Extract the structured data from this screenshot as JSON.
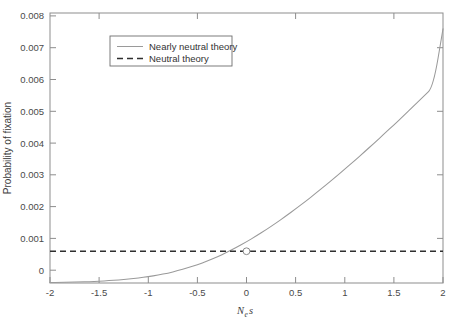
{
  "chart_data": {
    "type": "line",
    "title": "",
    "subtitle": "",
    "xlabel": "Nes",
    "xlabel_parts": {
      "main": "N",
      "sub": "e",
      "tail": "s"
    },
    "ylabel": "Probability of fixation",
    "xlim": [
      -2,
      2
    ],
    "ylim": [
      0,
      0.0085
    ],
    "grid": false,
    "legend_position": "upper-left-inset",
    "xticks": [
      -2,
      -1.5,
      -1,
      -0.5,
      0,
      0.5,
      1,
      1.5,
      2
    ],
    "xtick_labels": [
      "-2",
      "-1.5",
      "-1",
      "-0.5",
      "0",
      "0.5",
      "1",
      "1.5",
      "2"
    ],
    "yticks": [
      0,
      0.001,
      0.002,
      0.003,
      0.004,
      0.005,
      0.006,
      0.007,
      0.008
    ],
    "ytick_labels": [
      "0",
      "0.001",
      "0.002",
      "0.003",
      "0.004",
      "0.005",
      "0.006",
      "0.007",
      "0.008"
    ],
    "x": [
      -2,
      -1.9,
      -1.8,
      -1.7,
      -1.6,
      -1.5,
      -1.4,
      -1.3,
      -1.2,
      -1.1,
      -1,
      -0.9,
      -0.8,
      -0.7,
      -0.6,
      -0.5,
      -0.4,
      -0.3,
      -0.2,
      -0.1,
      0,
      0.1,
      0.2,
      0.3,
      0.4,
      0.5,
      0.6,
      0.7,
      0.8,
      0.9,
      1,
      1.1,
      1.2,
      1.3,
      1.4,
      1.5,
      1.6,
      1.7,
      1.8,
      1.9,
      2
    ],
    "series": [
      {
        "name": "Nearly neutral theory",
        "style": "solid",
        "color": "#9a9a9a",
        "values": [
          1.34e-05,
          1.81e-05,
          2.43e-05,
          3.24e-05,
          4.29e-05,
          5.64e-05,
          7.37e-05,
          9.56e-05,
          0.000123,
          0.000157,
          0.000199,
          0.00025,
          0.000312,
          0.000386,
          0.000473,
          0.000574,
          0.00069,
          0.00082,
          0.000965,
          0.001124,
          0.001297,
          0.001482,
          0.001679,
          0.001888,
          0.002106,
          0.002333,
          0.002569,
          0.002812,
          0.003063,
          0.00332,
          0.003583,
          0.003852,
          0.004126,
          0.004405,
          0.004689,
          0.004977,
          0.005269,
          0.005565,
          0.005864,
          0.006166,
          0.008
        ]
      },
      {
        "name": "Neutral theory",
        "style": "dashed",
        "color": "#2f2f2f",
        "constant_value": 0.001
      }
    ],
    "annotations": [
      {
        "name": "intersection-marker",
        "shape": "open-circle",
        "x": 0,
        "y": 0.001
      }
    ],
    "legend": [
      {
        "label": "Nearly neutral theory",
        "style": "solid",
        "color": "#9a9a9a"
      },
      {
        "label": "Neutral theory",
        "style": "dashed",
        "color": "#2f2f2f"
      }
    ]
  }
}
